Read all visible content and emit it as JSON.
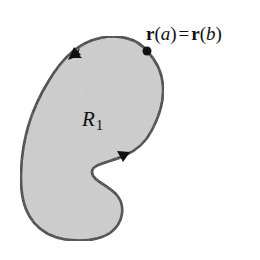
{
  "diagram": {
    "type": "closed-curve-region",
    "region": {
      "name": "R",
      "subscript": "1",
      "fill_color": "#c9c9c9"
    },
    "curve": {
      "stroke_color": "#111111",
      "orientation": "counterclockwise",
      "arrows": [
        {
          "position": "top-left",
          "direction": "down-left"
        },
        {
          "position": "right-notch",
          "direction": "right-up"
        }
      ]
    },
    "point": {
      "label_parts": {
        "r1": "r",
        "open1": "(",
        "a": "a",
        "close1": ")",
        "eq": "=",
        "r2": "r",
        "open2": "(",
        "b": "b",
        "close2": ")"
      },
      "label_text": "r(a) = r(b)"
    }
  }
}
